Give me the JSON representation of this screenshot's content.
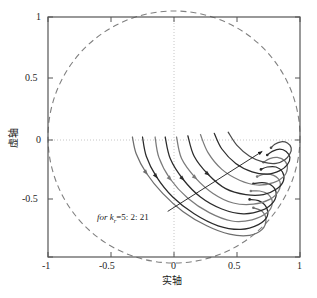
{
  "chart_data": {
    "type": "line",
    "title": "",
    "subtitle": "",
    "xlabel": "实轴",
    "ylabel": "虚轴",
    "xlim": [
      -1,
      1
    ],
    "ylim": [
      -1,
      1
    ],
    "xticks": [
      "-1",
      "-0.5",
      "0",
      "0.5",
      "1"
    ],
    "xtick_values": [
      -1,
      -0.5,
      0,
      0.5,
      1
    ],
    "yticks": [
      "1",
      "0.5",
      "0",
      "-0.5",
      "-1"
    ],
    "ytick_values": [
      1,
      0.5,
      0,
      -0.5,
      -1
    ],
    "grid": "dotted-axis-lines-only",
    "legend": "none",
    "annotations": [
      {
        "text_prefix": "for ",
        "variable": "k",
        "subscript": "r",
        "text_suffix": "=5: 2: 21",
        "full_text": "for k_r=5: 2: 21",
        "arrow_from": [
          -0.05,
          -0.62
        ],
        "arrow_to": [
          0.7,
          -0.12
        ]
      }
    ],
    "reference_curves": [
      {
        "name": "unit-circle",
        "style": "dashed",
        "color": "#808080",
        "center": [
          0,
          0
        ],
        "radius": 1.0
      }
    ],
    "series": [
      {
        "name": "locus-branch-1",
        "k_value": 5,
        "color": "#6e6e6e",
        "points": [
          [
            -0.33,
            0.0
          ],
          [
            -0.3,
            -0.14
          ],
          [
            -0.22,
            -0.3
          ],
          [
            -0.09,
            -0.47
          ],
          [
            0.07,
            -0.62
          ],
          [
            0.26,
            -0.74
          ],
          [
            0.44,
            -0.81
          ],
          [
            0.6,
            -0.82
          ],
          [
            0.7,
            -0.77
          ],
          [
            0.73,
            -0.69
          ],
          [
            0.7,
            -0.62
          ],
          [
            0.63,
            -0.59
          ]
        ]
      },
      {
        "name": "locus-branch-2",
        "k_value": 7,
        "color": "#2b2b2b",
        "points": [
          [
            -0.25,
            0.0
          ],
          [
            -0.22,
            -0.16
          ],
          [
            -0.14,
            -0.33
          ],
          [
            -0.01,
            -0.5
          ],
          [
            0.16,
            -0.64
          ],
          [
            0.35,
            -0.74
          ],
          [
            0.53,
            -0.77
          ],
          [
            0.67,
            -0.73
          ],
          [
            0.74,
            -0.66
          ],
          [
            0.73,
            -0.58
          ],
          [
            0.67,
            -0.53
          ],
          [
            0.6,
            -0.52
          ]
        ]
      },
      {
        "name": "locus-branch-3",
        "k_value": 9,
        "color": "#7a7a7a",
        "points": [
          [
            -0.15,
            0.0
          ],
          [
            -0.12,
            -0.17
          ],
          [
            -0.03,
            -0.35
          ],
          [
            0.11,
            -0.51
          ],
          [
            0.28,
            -0.63
          ],
          [
            0.46,
            -0.7
          ],
          [
            0.62,
            -0.69
          ],
          [
            0.74,
            -0.63
          ],
          [
            0.78,
            -0.55
          ],
          [
            0.75,
            -0.48
          ],
          [
            0.68,
            -0.45
          ],
          [
            0.61,
            -0.45
          ]
        ]
      },
      {
        "name": "locus-branch-4",
        "k_value": 11,
        "color": "#2b2b2b",
        "points": [
          [
            -0.07,
            0.0
          ],
          [
            -0.03,
            -0.18
          ],
          [
            0.07,
            -0.35
          ],
          [
            0.21,
            -0.5
          ],
          [
            0.38,
            -0.6
          ],
          [
            0.55,
            -0.64
          ],
          [
            0.7,
            -0.61
          ],
          [
            0.79,
            -0.54
          ],
          [
            0.81,
            -0.46
          ],
          [
            0.77,
            -0.4
          ],
          [
            0.7,
            -0.38
          ],
          [
            0.63,
            -0.39
          ]
        ]
      },
      {
        "name": "locus-branch-5",
        "k_value": 13,
        "color": "#7a7a7a",
        "points": [
          [
            0.02,
            0.0
          ],
          [
            0.06,
            -0.18
          ],
          [
            0.17,
            -0.34
          ],
          [
            0.31,
            -0.47
          ],
          [
            0.47,
            -0.55
          ],
          [
            0.63,
            -0.56
          ],
          [
            0.76,
            -0.52
          ],
          [
            0.83,
            -0.45
          ],
          [
            0.84,
            -0.37
          ],
          [
            0.79,
            -0.32
          ],
          [
            0.72,
            -0.31
          ],
          [
            0.66,
            -0.33
          ]
        ]
      },
      {
        "name": "locus-branch-6",
        "k_value": 15,
        "color": "#2b2b2b",
        "points": [
          [
            0.11,
            0.01
          ],
          [
            0.16,
            -0.16
          ],
          [
            0.27,
            -0.31
          ],
          [
            0.41,
            -0.43
          ],
          [
            0.57,
            -0.48
          ],
          [
            0.71,
            -0.48
          ],
          [
            0.82,
            -0.43
          ],
          [
            0.87,
            -0.36
          ],
          [
            0.86,
            -0.29
          ],
          [
            0.81,
            -0.25
          ],
          [
            0.74,
            -0.25
          ],
          [
            0.69,
            -0.27
          ]
        ]
      },
      {
        "name": "locus-branch-7",
        "k_value": 17,
        "color": "#7a7a7a",
        "points": [
          [
            0.21,
            0.02
          ],
          [
            0.27,
            -0.13
          ],
          [
            0.38,
            -0.27
          ],
          [
            0.52,
            -0.36
          ],
          [
            0.66,
            -0.4
          ],
          [
            0.79,
            -0.38
          ],
          [
            0.87,
            -0.33
          ],
          [
            0.9,
            -0.26
          ],
          [
            0.88,
            -0.2
          ],
          [
            0.82,
            -0.17
          ],
          [
            0.76,
            -0.18
          ],
          [
            0.71,
            -0.21
          ]
        ]
      },
      {
        "name": "locus-branch-8",
        "k_value": 19,
        "color": "#2b2b2b",
        "points": [
          [
            0.32,
            0.03
          ],
          [
            0.38,
            -0.1
          ],
          [
            0.49,
            -0.22
          ],
          [
            0.62,
            -0.29
          ],
          [
            0.74,
            -0.31
          ],
          [
            0.84,
            -0.28
          ],
          [
            0.9,
            -0.23
          ],
          [
            0.92,
            -0.17
          ],
          [
            0.89,
            -0.12
          ],
          [
            0.84,
            -0.1
          ],
          [
            0.78,
            -0.12
          ],
          [
            0.74,
            -0.15
          ]
        ]
      },
      {
        "name": "locus-branch-9",
        "k_value": 21,
        "color": "#4a4a4a",
        "points": [
          [
            0.43,
            0.04
          ],
          [
            0.5,
            -0.07
          ],
          [
            0.6,
            -0.16
          ],
          [
            0.71,
            -0.21
          ],
          [
            0.81,
            -0.22
          ],
          [
            0.88,
            -0.19
          ],
          [
            0.92,
            -0.14
          ],
          [
            0.93,
            -0.09
          ],
          [
            0.9,
            -0.05
          ],
          [
            0.85,
            -0.04
          ],
          [
            0.8,
            -0.06
          ],
          [
            0.77,
            -0.09
          ]
        ]
      }
    ]
  },
  "axes": {
    "frame_color": "#555555",
    "grid_color": "#bdbdbd",
    "circle_color": "#808080"
  }
}
